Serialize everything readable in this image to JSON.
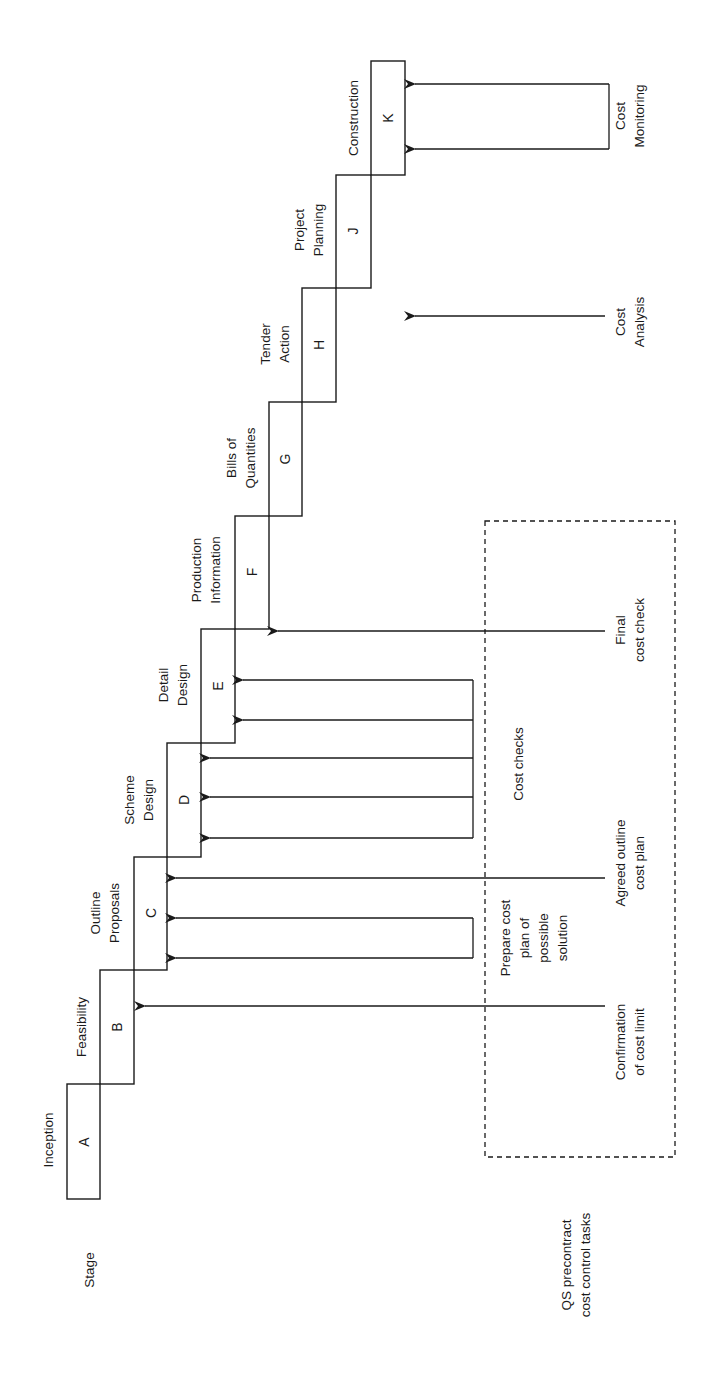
{
  "diagram": {
    "orientation": "rotated 90 degrees counter-clockwise",
    "row_labels": {
      "stage": "Stage",
      "qs_tasks_line1": "QS precontract",
      "qs_tasks_line2": "cost control tasks"
    },
    "stages": [
      {
        "letter": "A",
        "name_lines": [
          "Inception"
        ]
      },
      {
        "letter": "B",
        "name_lines": [
          "Feasibility"
        ]
      },
      {
        "letter": "C",
        "name_lines": [
          "Outline",
          "Proposals"
        ]
      },
      {
        "letter": "D",
        "name_lines": [
          "Scheme",
          "Design"
        ]
      },
      {
        "letter": "E",
        "name_lines": [
          "Detail",
          "Design"
        ]
      },
      {
        "letter": "F",
        "name_lines": [
          "Production",
          "Information"
        ]
      },
      {
        "letter": "G",
        "name_lines": [
          "Bills of",
          "Quantities"
        ]
      },
      {
        "letter": "H",
        "name_lines": [
          "Tender",
          "Action"
        ]
      },
      {
        "letter": "J",
        "name_lines": [
          "Project",
          "Planning"
        ]
      },
      {
        "letter": "K",
        "name_lines": [
          "Construction"
        ]
      }
    ],
    "tasks": [
      {
        "id": "confirmation",
        "lines": [
          "Confirmation",
          "of cost limit"
        ],
        "targets": [
          "B"
        ]
      },
      {
        "id": "prepare",
        "lines": [
          "Prepare cost",
          "plan of",
          "possible",
          "solution"
        ],
        "targets": [
          "C",
          "C"
        ]
      },
      {
        "id": "agreed",
        "lines": [
          "Agreed outline",
          "cost plan"
        ],
        "targets": [
          "C"
        ]
      },
      {
        "id": "cost-checks",
        "lines": [
          "Cost checks"
        ],
        "targets": [
          "D",
          "D",
          "D",
          "E",
          "E"
        ]
      },
      {
        "id": "final",
        "lines": [
          "Final",
          "cost check"
        ],
        "targets": [
          "F"
        ]
      },
      {
        "id": "analysis",
        "lines": [
          "Cost",
          "Analysis"
        ],
        "targets": [
          "H"
        ]
      },
      {
        "id": "monitoring",
        "lines": [
          "Cost",
          "Monitoring"
        ],
        "targets": [
          "K",
          "K"
        ]
      }
    ],
    "colors": {
      "ink": "#1a1a1a",
      "background": "#ffffff"
    }
  }
}
